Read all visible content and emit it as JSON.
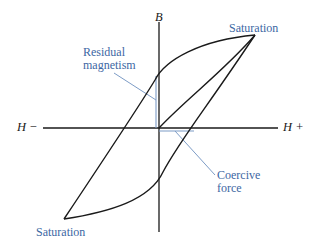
{
  "diagram": {
    "type": "hysteresis-loop",
    "axes": {
      "vertical_label": "B",
      "horizontal_negative_label": "H −",
      "horizontal_positive_label": "H +"
    },
    "annotations": {
      "saturation_top": "Saturation",
      "saturation_bottom": "Saturation",
      "residual_line1": "Residual",
      "residual_line2": "magnetism",
      "coercive_line1": "Coercive",
      "coercive_line2": "force"
    },
    "colors": {
      "curve": "#1a1a1a",
      "axis": "#1a1a1a",
      "annotation_text": "#3d67a3",
      "annotation_line": "#7d9cc6"
    }
  }
}
